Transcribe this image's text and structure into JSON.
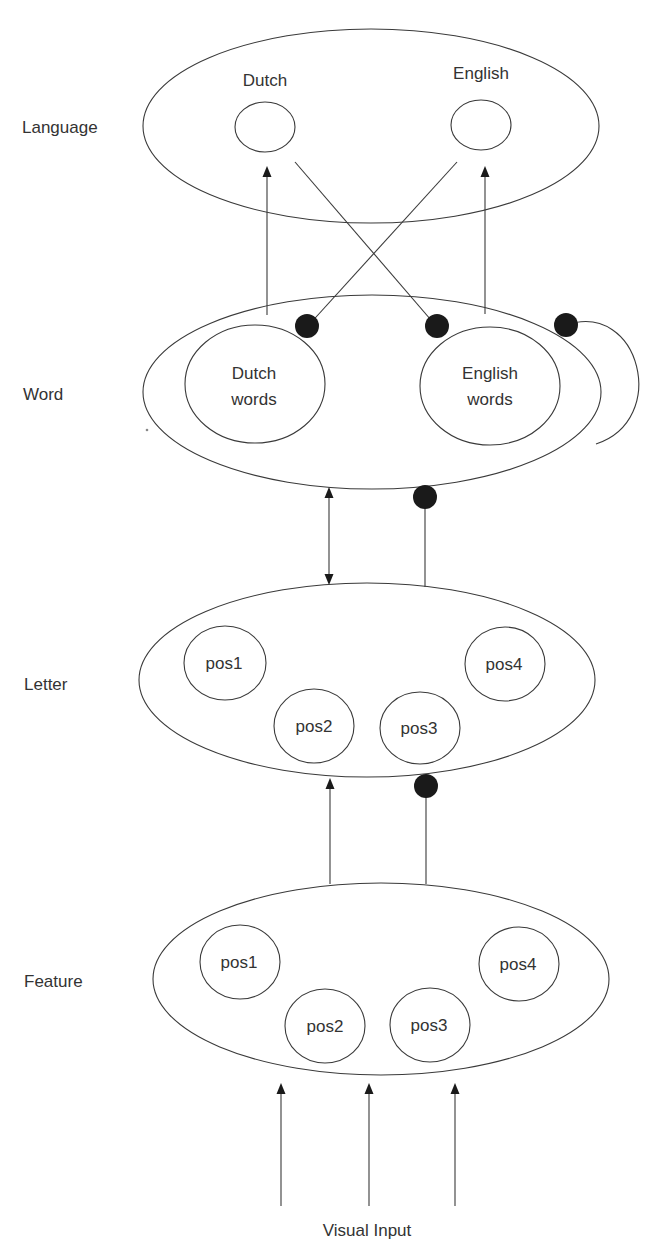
{
  "diagram": {
    "type": "interactive activation model (BIA)",
    "layers": [
      {
        "id": "language",
        "label": "Language"
      },
      {
        "id": "word",
        "label": "Word"
      },
      {
        "id": "letter",
        "label": "Letter"
      },
      {
        "id": "feature",
        "label": "Feature"
      }
    ],
    "language_nodes": [
      {
        "id": "dutch",
        "label": "Dutch"
      },
      {
        "id": "english",
        "label": "English"
      }
    ],
    "word_nodes": [
      {
        "id": "dutch-words",
        "line1": "Dutch",
        "line2": "words"
      },
      {
        "id": "english-words",
        "line1": "English",
        "line2": "words"
      }
    ],
    "letter_nodes": [
      {
        "label": "pos1"
      },
      {
        "label": "pos2"
      },
      {
        "label": "pos3"
      },
      {
        "label": "pos4"
      }
    ],
    "feature_nodes": [
      {
        "label": "pos1"
      },
      {
        "label": "pos2"
      },
      {
        "label": "pos3"
      },
      {
        "label": "pos4"
      }
    ],
    "input_label": "Visual Input",
    "connections": [
      {
        "from": "dutch-words",
        "to": "dutch",
        "kind": "excitatory"
      },
      {
        "from": "english-words",
        "to": "english",
        "kind": "excitatory"
      },
      {
        "from": "dutch",
        "to": "english-words",
        "kind": "inhibitory"
      },
      {
        "from": "english",
        "to": "dutch-words",
        "kind": "inhibitory"
      },
      {
        "from": "word",
        "to": "word",
        "kind": "inhibitory (lateral)"
      },
      {
        "from": "word",
        "to": "letter",
        "kind": "bidirectional excitatory"
      },
      {
        "from": "letter",
        "to": "word",
        "kind": "inhibitory"
      },
      {
        "from": "feature",
        "to": "letter",
        "kind": "excitatory"
      },
      {
        "from": "feature",
        "to": "letter",
        "kind": "inhibitory"
      },
      {
        "from": "visual-input",
        "to": "feature",
        "kind": "excitatory",
        "count": 3
      }
    ],
    "colors": {
      "stroke": "#3a3a3a",
      "text": "#333333",
      "inhibitory_dot": "#1a1a1a",
      "background": "#ffffff"
    }
  }
}
